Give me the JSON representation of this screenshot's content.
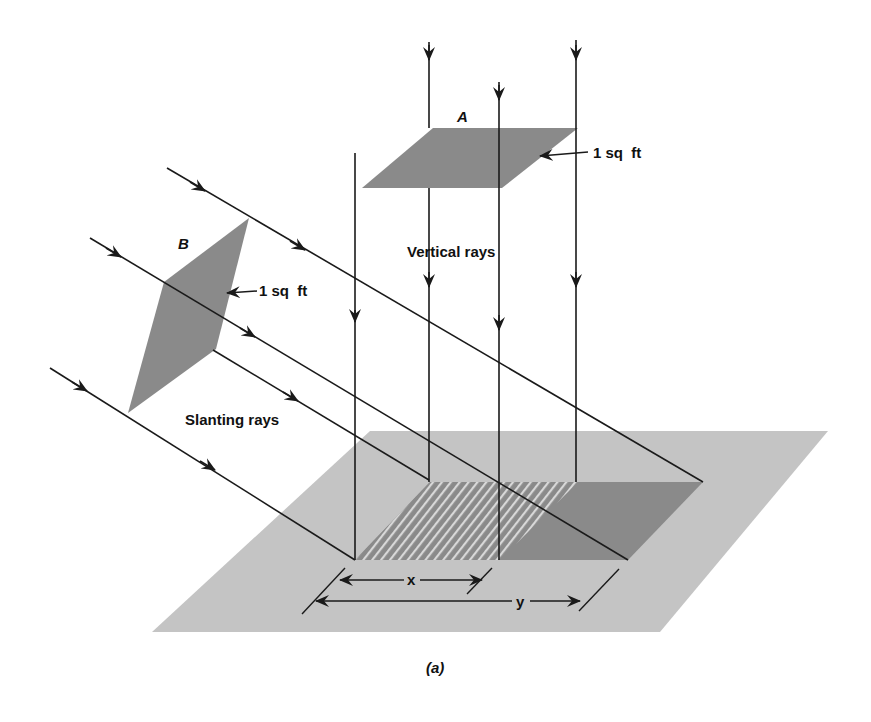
{
  "figure": {
    "caption": "(a)",
    "colors": {
      "background": "#ffffff",
      "ground": "#c4c4c4",
      "patch": "#8a8a8a",
      "hatch_line": "#d8d8d8",
      "ray": "#1a1a1a"
    }
  },
  "square_a": {
    "label": "A",
    "area_label": "1 sq  ft"
  },
  "square_b": {
    "label": "B",
    "area_label": "1 sq  ft"
  },
  "vertical_rays": {
    "label": "Vertical rays"
  },
  "slanting_rays": {
    "label": "Slanting rays"
  },
  "dimensions": {
    "x_label": "x",
    "y_label": "y"
  }
}
